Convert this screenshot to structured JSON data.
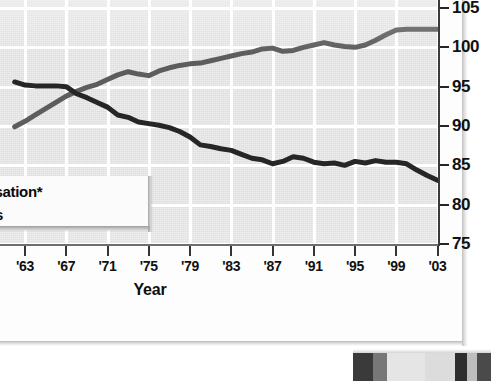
{
  "figure": {
    "background_color": "#ffffff",
    "card_color": "#fdfdfd"
  },
  "legend": {
    "items": [
      {
        "label": "l compensation*",
        "full_label_clipped": "Real compensation*",
        "color": "#5d5d5d",
        "swatch_name": "legend-swatch-compensation"
      },
      {
        "label": "ekly hours",
        "full_label_clipped": "Weekly hours",
        "color": "#262626",
        "swatch_name": "legend-swatch-hours"
      }
    ]
  },
  "source": {
    "text": "cs"
  },
  "chart_data": {
    "type": "line",
    "title": "",
    "xlabel": "Year",
    "ylabel": "",
    "xlim": [
      1962,
      2003
    ],
    "ylim": [
      75,
      105
    ],
    "xticks": [
      "'63",
      "'67",
      "'71",
      "'75",
      "'79",
      "'83",
      "'87",
      "'91",
      "'95",
      "'99",
      "'03"
    ],
    "xtick_values": [
      1963,
      1967,
      1971,
      1975,
      1979,
      1983,
      1987,
      1991,
      1995,
      1999,
      2003
    ],
    "yticks": [
      105,
      100,
      95,
      90,
      85,
      80,
      75
    ],
    "grid": true,
    "grid_color": "#ffffff",
    "plot_background": "#dedede",
    "legend_position": "inside-lower-left",
    "series": [
      {
        "name": "Real compensation*",
        "color": "#5d5d5d",
        "x": [
          1962,
          1963,
          1964,
          1965,
          1966,
          1967,
          1968,
          1969,
          1970,
          1971,
          1972,
          1973,
          1974,
          1975,
          1976,
          1977,
          1978,
          1979,
          1980,
          1981,
          1982,
          1983,
          1984,
          1985,
          1986,
          1987,
          1988,
          1989,
          1990,
          1991,
          1992,
          1993,
          1994,
          1995,
          1996,
          1997,
          1998,
          1999,
          2000,
          2001,
          2002,
          2003
        ],
        "values": [
          89.9,
          90.6,
          91.4,
          92.2,
          93.0,
          93.8,
          94.4,
          94.9,
          95.3,
          95.9,
          96.5,
          96.9,
          96.6,
          96.4,
          97.0,
          97.4,
          97.7,
          97.9,
          98.0,
          98.3,
          98.6,
          98.9,
          99.2,
          99.4,
          99.8,
          99.9,
          99.5,
          99.6,
          100.0,
          100.3,
          100.6,
          100.3,
          100.1,
          100.0,
          100.3,
          100.9,
          101.6,
          102.2,
          102.3,
          102.3,
          102.3,
          102.3
        ]
      },
      {
        "name": "Weekly hours",
        "color": "#262626",
        "x": [
          1962,
          1963,
          1964,
          1965,
          1966,
          1967,
          1968,
          1969,
          1970,
          1971,
          1972,
          1973,
          1974,
          1975,
          1976,
          1977,
          1978,
          1979,
          1980,
          1981,
          1982,
          1983,
          1984,
          1985,
          1986,
          1987,
          1988,
          1989,
          1990,
          1991,
          1992,
          1993,
          1994,
          1995,
          1996,
          1997,
          1998,
          1999,
          2000,
          2001,
          2002,
          2003
        ],
        "values": [
          95.6,
          95.2,
          95.1,
          95.1,
          95.1,
          95.0,
          94.1,
          93.6,
          93.0,
          92.4,
          91.4,
          91.1,
          90.5,
          90.3,
          90.1,
          89.8,
          89.3,
          88.6,
          87.6,
          87.4,
          87.1,
          86.9,
          86.4,
          85.9,
          85.7,
          85.2,
          85.5,
          86.1,
          85.9,
          85.4,
          85.2,
          85.3,
          85.0,
          85.5,
          85.3,
          85.6,
          85.4,
          85.4,
          85.2,
          84.4,
          83.7,
          83.1
        ]
      }
    ]
  },
  "photo_fragment": {
    "name": "photo-strip",
    "tiles": [
      {
        "left": 0,
        "width": 20,
        "color": "#3a3a3a"
      },
      {
        "left": 20,
        "width": 14,
        "color": "#777777"
      },
      {
        "left": 34,
        "width": 38,
        "color": "#e5e5e5"
      },
      {
        "left": 72,
        "width": 30,
        "color": "#dcdcdc"
      },
      {
        "left": 102,
        "width": 12,
        "color": "#2e2e2e"
      },
      {
        "left": 114,
        "width": 10,
        "color": "#bdbdbd"
      },
      {
        "left": 124,
        "width": 14,
        "color": "#4a4a4a"
      }
    ]
  }
}
